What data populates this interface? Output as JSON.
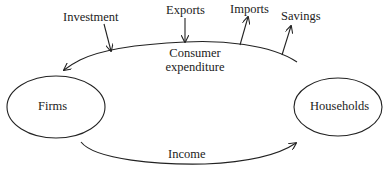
{
  "diagram": {
    "nodes": {
      "firms": {
        "label": "Firms"
      },
      "households": {
        "label": "Households"
      }
    },
    "flows": {
      "consumer_expenditure": {
        "label_line1": "Consumer",
        "label_line2": "expenditure",
        "direction": "households-to-firms"
      },
      "income": {
        "label": "Income",
        "direction": "firms-to-households"
      }
    },
    "injections": [
      {
        "label": "Investment"
      },
      {
        "label": "Exports"
      }
    ],
    "withdrawals": [
      {
        "label": "Imports"
      },
      {
        "label": "Savings"
      }
    ],
    "colors": {
      "stroke": "#222222",
      "text": "#222222",
      "background": "#ffffff"
    }
  }
}
